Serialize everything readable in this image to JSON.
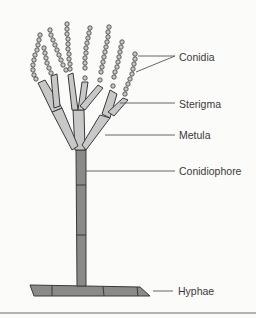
{
  "diagram": {
    "labels": [
      {
        "id": "conidia",
        "text": "Conidia",
        "x": 179,
        "y": 51
      },
      {
        "id": "sterigma",
        "text": "Sterigma",
        "x": 179,
        "y": 98
      },
      {
        "id": "metula",
        "text": "Metula",
        "x": 179,
        "y": 129
      },
      {
        "id": "conidiophore",
        "text": "Conidiophore",
        "x": 179,
        "y": 165
      },
      {
        "id": "hyphae",
        "text": "Hyphae",
        "x": 178,
        "y": 285
      }
    ]
  },
  "colors": {
    "background": "#fbfbf9",
    "fill_light": "#c8c8c8",
    "fill_dark": "#8a8a8a",
    "outline": "#3a3a3a",
    "leader": "#555555"
  }
}
